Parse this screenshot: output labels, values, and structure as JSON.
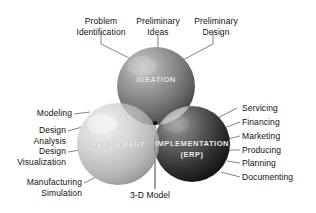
{
  "figure": {
    "background_color": "#ffffff",
    "text_color": "#101010"
  },
  "spheres": [
    {
      "id": "ideation",
      "label": "IDEATION",
      "sublabel": "",
      "shade": "dark-gray",
      "fill_light": "#b9b9b9",
      "fill_dark": "#4a4a4a",
      "cx": 156,
      "cy": 86,
      "r": 39
    },
    {
      "id": "refinement",
      "label": "REFINEMENT",
      "sublabel": "",
      "shade": "light-gray",
      "fill_light": "#e4e4e4",
      "fill_dark": "#9a9a9a",
      "cx": 118,
      "cy": 144,
      "r": 41
    },
    {
      "id": "implementation",
      "label": "IMPLEMENTATION",
      "sublabel": "(ERP)",
      "shade": "darkest",
      "fill_light": "#8e8e8e",
      "fill_dark": "#1e1e1e",
      "cx": 192,
      "cy": 144,
      "r": 38
    }
  ],
  "center_point": {
    "label": "3-D Model",
    "x": 155,
    "y": 123
  },
  "callouts_top": [
    {
      "line1": "Problem",
      "line2": "Identification"
    },
    {
      "line1": "Preliminary",
      "line2": "Ideas"
    },
    {
      "line1": "Preliminary",
      "line2": "Design"
    }
  ],
  "callouts_left": [
    {
      "line1": "Modeling",
      "line2": ""
    },
    {
      "line1": "Design",
      "line2": "Analysis"
    },
    {
      "line1": "Design",
      "line2": "Visualization"
    },
    {
      "line1": "Manufacturing",
      "line2": "Simulation"
    }
  ],
  "callouts_right": [
    {
      "label": "Servicing"
    },
    {
      "label": "Financing"
    },
    {
      "label": "Marketing"
    },
    {
      "label": "Producing"
    },
    {
      "label": "Planning"
    },
    {
      "label": "Documenting"
    }
  ]
}
